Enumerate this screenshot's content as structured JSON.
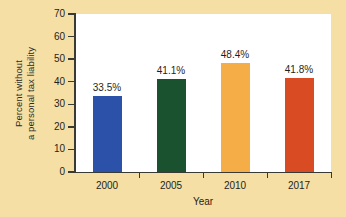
{
  "chart_data": {
    "type": "bar",
    "title": "",
    "categories": [
      "2000",
      "2005",
      "2010",
      "2017"
    ],
    "values": [
      33.5,
      41.1,
      48.4,
      41.8
    ],
    "value_labels": [
      "33.5%",
      "41.1%",
      "48.4%",
      "41.8%"
    ],
    "bar_colors": [
      "#2b52a8",
      "#1a5230",
      "#f5ae47",
      "#d94b22"
    ],
    "xlabel": "Year",
    "ylabel_line1": "Percent without",
    "ylabel_line2": "a personal tax liability",
    "ylim": [
      0,
      70
    ],
    "yticks": [
      0,
      10,
      20,
      30,
      40,
      50,
      60,
      70
    ],
    "ytick_labels": [
      "0",
      "10",
      "20",
      "30",
      "40",
      "50",
      "60",
      "70"
    ],
    "grid": false,
    "legend": false
  },
  "colors": {
    "background": "#f5dfa5",
    "plot_background": "#ffffff",
    "axis": "#3a3a35",
    "text": "#1f1f1c"
  }
}
